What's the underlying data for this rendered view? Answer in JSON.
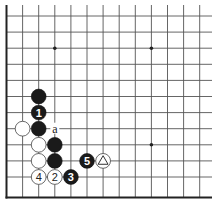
{
  "diagram": {
    "type": "go-board-partial",
    "corner": "bottom-left",
    "visible_columns": 13,
    "visible_rows": 12,
    "star_points": [
      {
        "col": 3,
        "row": 2
      },
      {
        "col": 9,
        "row": 2
      },
      {
        "col": 9,
        "row": 8
      }
    ],
    "stones": [
      {
        "color": "black",
        "col": 2,
        "row": 5,
        "label": ""
      },
      {
        "color": "black",
        "col": 2,
        "row": 6,
        "label": "1"
      },
      {
        "color": "black",
        "col": 2,
        "row": 7,
        "label": ""
      },
      {
        "color": "white",
        "col": 1,
        "row": 7,
        "label": ""
      },
      {
        "color": "white",
        "col": 2,
        "row": 8,
        "label": ""
      },
      {
        "color": "black",
        "col": 3,
        "row": 8,
        "label": ""
      },
      {
        "color": "white",
        "col": 2,
        "row": 9,
        "label": ""
      },
      {
        "color": "black",
        "col": 3,
        "row": 9,
        "label": ""
      },
      {
        "color": "black",
        "col": 5,
        "row": 9,
        "label": "5"
      },
      {
        "color": "white",
        "col": 6,
        "row": 9,
        "label": "triangle"
      },
      {
        "color": "white",
        "col": 2,
        "row": 10,
        "label": "4"
      },
      {
        "color": "white",
        "col": 3,
        "row": 10,
        "label": "2"
      },
      {
        "color": "black",
        "col": 4,
        "row": 10,
        "label": "3"
      }
    ],
    "point_labels": [
      {
        "col": 3,
        "row": 7,
        "text": "a"
      }
    ]
  }
}
